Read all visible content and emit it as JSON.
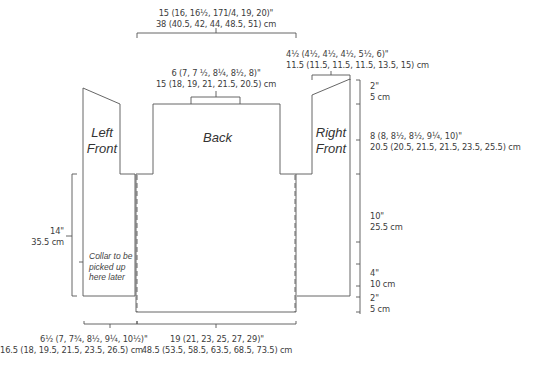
{
  "diagram": {
    "line_color": "#555555",
    "pieces": {
      "left_front": [
        "Left",
        "Front"
      ],
      "back": "Back",
      "right_front": [
        "Right",
        "Front"
      ]
    },
    "note": [
      "Collar to be",
      "picked up",
      "here later"
    ],
    "measurements": {
      "top_width": {
        "in": "15 (16, 16½, 171/4, 19, 20)\"",
        "cm": "38 (40.5, 42, 44, 48.5, 51) cm"
      },
      "neck_width": {
        "in": "6 (7, 7 ½, 8¼, 8½, 8)\"",
        "cm": "15 (18, 19, 21, 21.5, 20.5) cm"
      },
      "shoulder_width": {
        "in": "4½ (4½, 4½, 4½, 5½, 6)\"",
        "cm": "11.5 (11.5, 11.5, 11.5, 13.5, 15) cm"
      },
      "shoulder_slope": {
        "in": "2\"",
        "cm": "5 cm"
      },
      "armhole_depth": {
        "in": "8 (8, 8½, 8½, 9¼, 10)\"",
        "cm": "20.5 (20.5, 21.5, 21.5, 23.5, 25.5) cm"
      },
      "side_length": {
        "in": "10\"",
        "cm": "25.5 cm"
      },
      "front_hem": {
        "in": "4\"",
        "cm": "10 cm"
      },
      "back_hem": {
        "in": "2\"",
        "cm": "5 cm"
      },
      "front_length": {
        "in": "14\"",
        "cm": "35.5 cm"
      },
      "front_width": {
        "in": "6½ (7, 7¾, 8½, 9¼, 10½)\"",
        "cm": "16.5 (18, 19.5, 21.5, 23.5, 26.5) cm"
      },
      "back_width": {
        "in": "19 (21, 23, 25, 27, 29)\"",
        "cm": "48.5 (53.5, 58.5, 63.5, 68.5, 73.5) cm"
      }
    }
  }
}
